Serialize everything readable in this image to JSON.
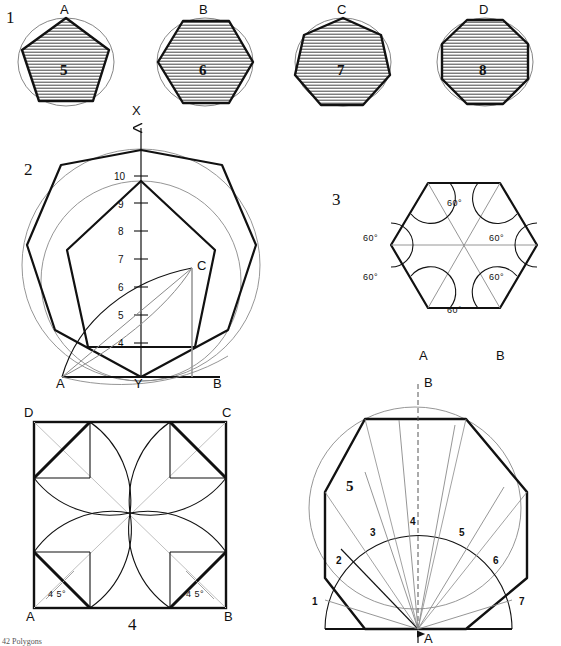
{
  "figure": {
    "caption": "42  Polygons",
    "background": "#ffffff",
    "ink": "#111111",
    "light_ink": "#8a8a8a"
  },
  "panels": [
    {
      "id": "panel-1",
      "number": "1",
      "type": "inscribed-polygons-row",
      "items": [
        {
          "letter": "A",
          "sides_label": "5",
          "sides": 5,
          "name": "pentagon"
        },
        {
          "letter": "B",
          "sides_label": "6",
          "sides": 6,
          "name": "hexagon"
        },
        {
          "letter": "C",
          "sides_label": "7",
          "sides": 7,
          "name": "heptagon"
        },
        {
          "letter": "D",
          "sides_label": "8",
          "sides": 8,
          "name": "octagon"
        }
      ]
    },
    {
      "id": "panel-2",
      "number": "2",
      "type": "general-polygon-construction",
      "axis_labels": {
        "vertical": "X",
        "center_base": "Y"
      },
      "points": [
        {
          "label": "A",
          "role": "base-left"
        },
        {
          "label": "B",
          "role": "base-right"
        },
        {
          "label": "C",
          "role": "arc-intersection"
        }
      ],
      "scale_numbers": [
        "10",
        "9",
        "8",
        "7",
        "6",
        "5",
        "4"
      ]
    },
    {
      "id": "panel-3",
      "number": "3",
      "type": "hexagon-60-degree",
      "angle_labels": [
        "60°",
        "60°",
        "60°",
        "60°",
        "60°",
        "60°"
      ],
      "points": [
        {
          "label": "A",
          "role": "base-left"
        },
        {
          "label": "B",
          "role": "base-right"
        }
      ]
    },
    {
      "id": "panel-4",
      "number": "4",
      "type": "octagon-in-square",
      "corner_labels": [
        "D",
        "C",
        "A",
        "B"
      ],
      "angle_labels": [
        "4 5°",
        "4 5°"
      ]
    },
    {
      "id": "panel-5",
      "number": "5",
      "type": "octagon-radial-construction",
      "inner_number": "5",
      "division_numbers": [
        "1",
        "2",
        "3",
        "4",
        "5",
        "6",
        "7"
      ],
      "points": [
        {
          "label": "B",
          "role": "apex-top"
        },
        {
          "label": "A",
          "role": "centre-base"
        }
      ]
    }
  ]
}
